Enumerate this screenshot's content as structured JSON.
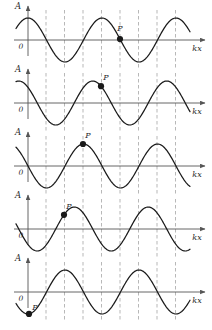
{
  "figure": {
    "panel_count": 5,
    "axis": {
      "vertical_label": "A",
      "origin_label": "0",
      "horizontal_label": "kx"
    },
    "colors": {
      "curve": "#1a1a1a",
      "axis": "#555555",
      "gridline": "#9a9a9a",
      "point": "#1a1a1a",
      "background": "#ffffff"
    },
    "geometry": {
      "width": 212,
      "height": 330,
      "origin_x": 28,
      "curve_left_x": 16,
      "curve_right_x": 190,
      "axis_end_x": 205,
      "amplitude": 22,
      "wavelength": 74,
      "gridline_spacing": 18.5,
      "gridline_count": 9,
      "gridline_first_x": 46
    },
    "panels": [
      {
        "index": 1,
        "baseline_y": 40,
        "phase_label": "0",
        "phase_fraction": 0.0,
        "point_p": {
          "label": "P",
          "x": 120,
          "y": 18,
          "label_dx": 0,
          "label_dy": -6
        },
        "curve_start_value": 1.0
      },
      {
        "index": 2,
        "baseline_y": 103,
        "phase_label": "1/8",
        "phase_fraction": 0.125,
        "point_p": {
          "label": "P",
          "x": 101,
          "y": 81,
          "label_dx": 5,
          "label_dy": -4
        },
        "curve_start_value": 0.0
      },
      {
        "index": 3,
        "baseline_y": 166,
        "phase_label": "1/4",
        "phase_fraction": 0.25,
        "point_p": {
          "label": "P",
          "x": 83,
          "y": 144,
          "label_dx": 5,
          "label_dy": -4
        },
        "curve_start_value": -1.0
      },
      {
        "index": 4,
        "baseline_y": 229,
        "phase_label": "3/8",
        "phase_fraction": 0.375,
        "point_p": {
          "label": "P",
          "x": 64,
          "y": 207,
          "label_dx": 5,
          "label_dy": -4
        },
        "curve_start_value": 0.0
      },
      {
        "index": 5,
        "baseline_y": 292,
        "phase_label": "1/2",
        "phase_fraction": 0.5,
        "point_p": {
          "label": "P",
          "x": 29,
          "y": 270,
          "label_dx": 6,
          "label_dy": -2
        },
        "curve_start_value": 1.0
      }
    ]
  }
}
